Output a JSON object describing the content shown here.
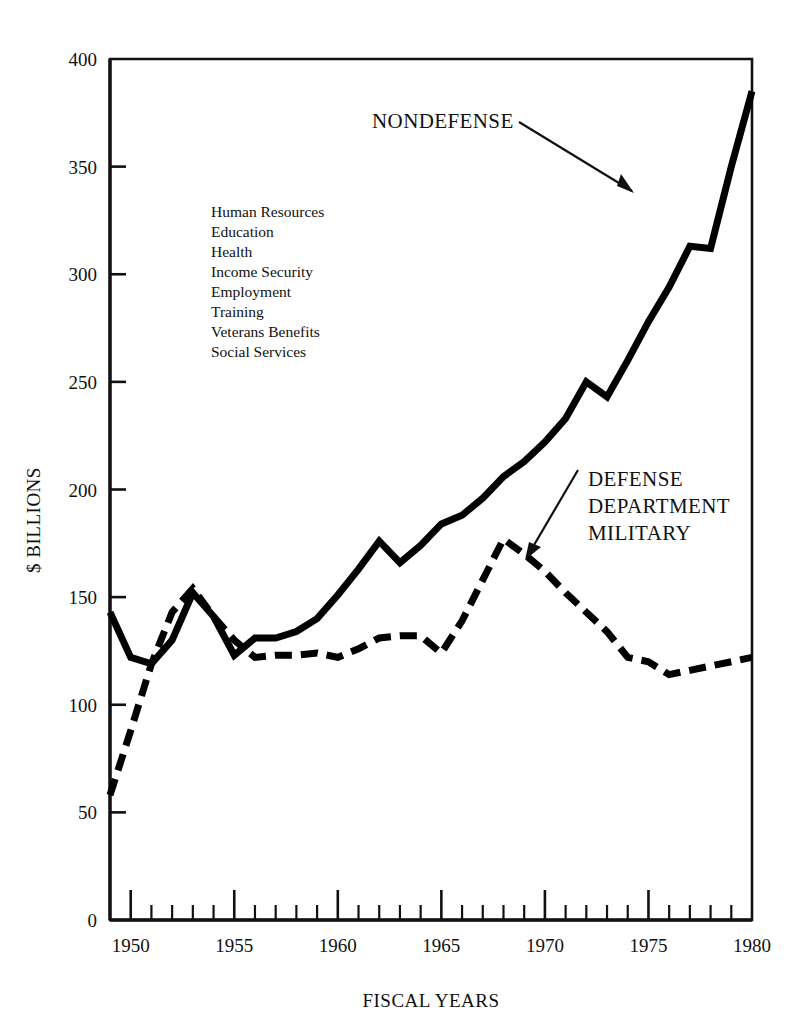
{
  "chart_data": {
    "type": "line",
    "title": "",
    "xlabel": "FISCAL YEARS",
    "ylabel": "$ BILLIONS",
    "xlim": [
      1949,
      1980
    ],
    "ylim": [
      0,
      400
    ],
    "yticks": [
      0,
      50,
      100,
      150,
      200,
      250,
      300,
      350,
      400
    ],
    "xticks_major": [
      1950,
      1955,
      1960,
      1965,
      1970,
      1975,
      1980
    ],
    "xticks_minor_step": 1,
    "grid": false,
    "legend_position": "inline-annotations",
    "x": [
      1949,
      1950,
      1951,
      1952,
      1953,
      1954,
      1955,
      1956,
      1957,
      1958,
      1959,
      1960,
      1961,
      1962,
      1963,
      1964,
      1965,
      1966,
      1967,
      1968,
      1969,
      1970,
      1971,
      1972,
      1973,
      1974,
      1975,
      1976,
      1977,
      1978,
      1979,
      1980
    ],
    "series": [
      {
        "name": "NONDEFENSE",
        "style": "solid",
        "values": [
          143,
          122,
          119,
          130,
          152,
          141,
          123,
          131,
          131,
          134,
          140,
          151,
          163,
          176,
          166,
          174,
          184,
          188,
          196,
          206,
          213,
          222,
          233,
          250,
          243,
          260,
          278,
          294,
          313,
          312,
          350,
          385
        ]
      },
      {
        "name": "DEFENSE DEPARTMENT MILITARY",
        "style": "dashed",
        "values": [
          58,
          88,
          119,
          143,
          154,
          141,
          130,
          122,
          123,
          123,
          124,
          122,
          126,
          131,
          132,
          132,
          124,
          139,
          158,
          177,
          170,
          162,
          152,
          143,
          134,
          122,
          120,
          114,
          116,
          118,
          120,
          122
        ]
      }
    ],
    "annotations": [
      {
        "name": "nondefense-label",
        "text": "NONDEFENSE",
        "points_to_year": 1974,
        "points_to_value": 338
      },
      {
        "name": "defense-label",
        "text_lines": [
          "DEFENSE",
          "DEPARTMENT",
          "MILITARY"
        ],
        "points_to_year": 1968,
        "points_to_value": 175
      },
      {
        "name": "nondefense-components-note",
        "lines": [
          "Human Resources",
          "Education",
          "Health",
          "Income Security",
          "Employment",
          "Training",
          "Veterans Benefits",
          "Social Services"
        ]
      }
    ]
  },
  "axes": {
    "y_title": "$ BILLIONS",
    "x_title": "FISCAL YEARS",
    "y_tick_labels": [
      "0",
      "50",
      "100",
      "150",
      "200",
      "250",
      "300",
      "350",
      "400"
    ],
    "x_tick_labels": [
      "1950",
      "1955",
      "1960",
      "1965",
      "1970",
      "1975",
      "1980"
    ]
  },
  "labels": {
    "nondefense": "NONDEFENSE",
    "defense_1": "DEFENSE",
    "defense_2": "DEPARTMENT",
    "defense_3": "MILITARY"
  },
  "note": {
    "l1": "Human Resources",
    "l2": "Education",
    "l3": "Health",
    "l4": "Income Security",
    "l5": "Employment",
    "l6": "Training",
    "l7": "Veterans Benefits",
    "l8": "Social Services"
  },
  "colors": {
    "ink": "#111111",
    "background": "#ffffff",
    "series": "#000000"
  }
}
